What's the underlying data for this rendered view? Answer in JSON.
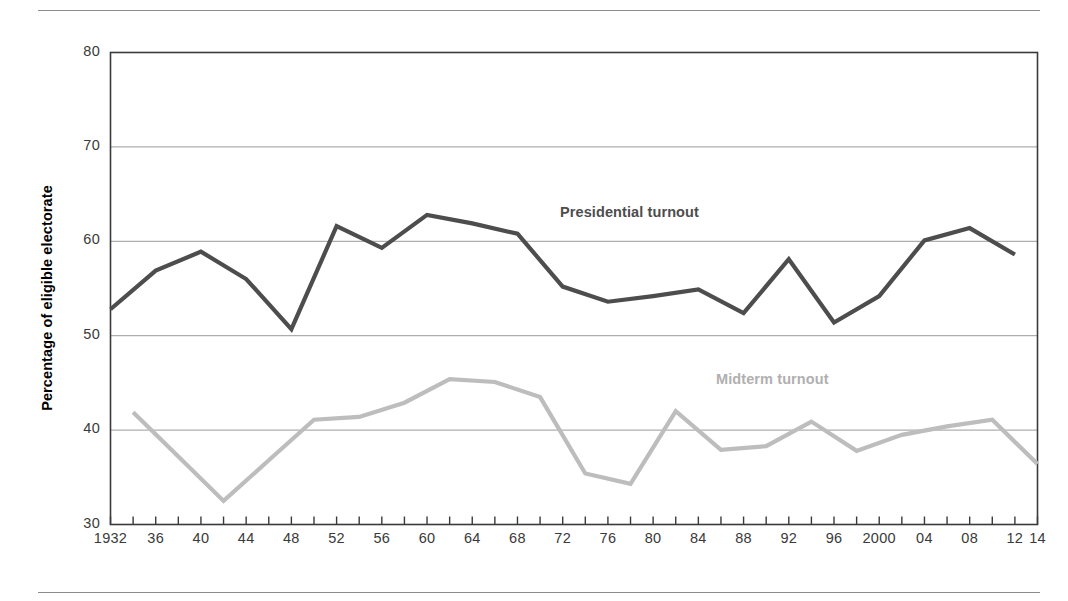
{
  "figure": {
    "ylabel": "Percentage of eligible electorate",
    "series_labels": {
      "presidential": "Presidential turnout",
      "midterm": "Midterm turnout"
    }
  },
  "colors": {
    "presidential_line": "#4d4d4d",
    "midterm_line": "#bdbdbd",
    "axis": "#3a3a3a",
    "gridline": "#9a9a9a",
    "rule": "#8d8d8d"
  },
  "chart_data": {
    "type": "line",
    "title": "",
    "xlabel": "",
    "ylabel": "Percentage of eligible electorate",
    "ylim": [
      30,
      80
    ],
    "yticks": [
      30,
      40,
      50,
      60,
      70,
      80
    ],
    "ytick_labels": [
      "30",
      "40",
      "50",
      "60",
      "70",
      "80"
    ],
    "xlim": [
      1932,
      2014
    ],
    "xticks": [
      1932,
      1934,
      1936,
      1938,
      1940,
      1942,
      1944,
      1946,
      1948,
      1950,
      1952,
      1954,
      1956,
      1958,
      1960,
      1962,
      1964,
      1966,
      1968,
      1970,
      1972,
      1974,
      1976,
      1978,
      1980,
      1982,
      1984,
      1986,
      1988,
      1990,
      1992,
      1994,
      1996,
      1998,
      2000,
      2002,
      2004,
      2006,
      2008,
      2010,
      2012,
      2014
    ],
    "xtick_labels": [
      {
        "year": 1932,
        "label": "1932"
      },
      {
        "year": 1936,
        "label": "36"
      },
      {
        "year": 1940,
        "label": "40"
      },
      {
        "year": 1944,
        "label": "44"
      },
      {
        "year": 1948,
        "label": "48"
      },
      {
        "year": 1952,
        "label": "52"
      },
      {
        "year": 1956,
        "label": "56"
      },
      {
        "year": 1960,
        "label": "60"
      },
      {
        "year": 1964,
        "label": "64"
      },
      {
        "year": 1968,
        "label": "68"
      },
      {
        "year": 1972,
        "label": "72"
      },
      {
        "year": 1976,
        "label": "76"
      },
      {
        "year": 1980,
        "label": "80"
      },
      {
        "year": 1984,
        "label": "84"
      },
      {
        "year": 1988,
        "label": "88"
      },
      {
        "year": 1992,
        "label": "92"
      },
      {
        "year": 1996,
        "label": "96"
      },
      {
        "year": 2000,
        "label": "2000"
      },
      {
        "year": 2004,
        "label": "04"
      },
      {
        "year": 2008,
        "label": "08"
      },
      {
        "year": 2012,
        "label": "12"
      },
      {
        "year": 2014,
        "label": "14"
      }
    ],
    "grid": true,
    "legend": "inline-labels",
    "series": [
      {
        "name": "Presidential turnout",
        "color": "#4d4d4d",
        "x": [
          1932,
          1936,
          1940,
          1944,
          1948,
          1952,
          1956,
          1960,
          1964,
          1968,
          1972,
          1976,
          1980,
          1984,
          1988,
          1992,
          1996,
          2000,
          2004,
          2008,
          2012
        ],
        "values": [
          52.8,
          56.9,
          58.9,
          56.0,
          50.7,
          61.6,
          59.3,
          62.8,
          61.9,
          60.8,
          55.2,
          53.6,
          54.2,
          54.9,
          52.4,
          58.1,
          51.4,
          54.2,
          60.1,
          61.4,
          58.6
        ]
      },
      {
        "name": "Midterm turnout",
        "color": "#bdbdbd",
        "x": [
          1934,
          1938,
          1942,
          1946,
          1950,
          1954,
          1958,
          1962,
          1966,
          1970,
          1974,
          1978,
          1982,
          1986,
          1990,
          1994,
          1998,
          2002,
          2006,
          2010,
          2014
        ],
        "values": [
          41.9,
          37.2,
          32.5,
          36.8,
          41.1,
          41.4,
          42.9,
          45.4,
          45.1,
          43.5,
          35.4,
          34.3,
          42.0,
          37.9,
          38.3,
          40.9,
          37.8,
          39.5,
          40.4,
          41.1,
          36.4
        ]
      }
    ]
  }
}
